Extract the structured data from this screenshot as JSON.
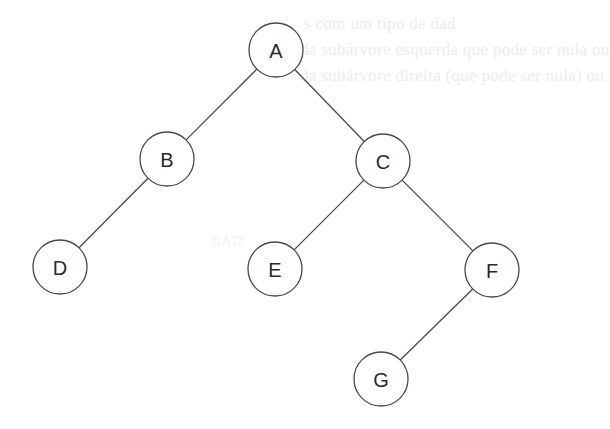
{
  "diagram": {
    "type": "binary-tree",
    "colors": {
      "edge": "#4a4a4a",
      "node_stroke": "#4a4a4a",
      "node_fill": "#ffffff",
      "label": "#2a2a2a",
      "background": "#ffffff"
    },
    "node_radius": 27,
    "nodes": [
      {
        "id": "A",
        "label": "A",
        "cx": 276,
        "cy": 50
      },
      {
        "id": "B",
        "label": "B",
        "cx": 167,
        "cy": 159
      },
      {
        "id": "C",
        "label": "C",
        "cx": 383,
        "cy": 161
      },
      {
        "id": "D",
        "label": "D",
        "cx": 60,
        "cy": 267
      },
      {
        "id": "E",
        "label": "E",
        "cx": 275,
        "cy": 269
      },
      {
        "id": "F",
        "label": "F",
        "cx": 492,
        "cy": 270
      },
      {
        "id": "G",
        "label": "G",
        "cx": 381,
        "cy": 379
      }
    ],
    "edges": [
      {
        "from": "A",
        "to": "B"
      },
      {
        "from": "A",
        "to": "C"
      },
      {
        "from": "B",
        "to": "D"
      },
      {
        "from": "C",
        "to": "E"
      },
      {
        "from": "C",
        "to": "F"
      },
      {
        "from": "F",
        "to": "G"
      }
    ]
  },
  "background_showthrough": {
    "line1": "s com um tipo de dad",
    "line2": "da subárvore esquerda que pode ser nula ou",
    "line3": "da subárvore direita (que pode ser nula) ou",
    "mid": "RAIZ"
  }
}
